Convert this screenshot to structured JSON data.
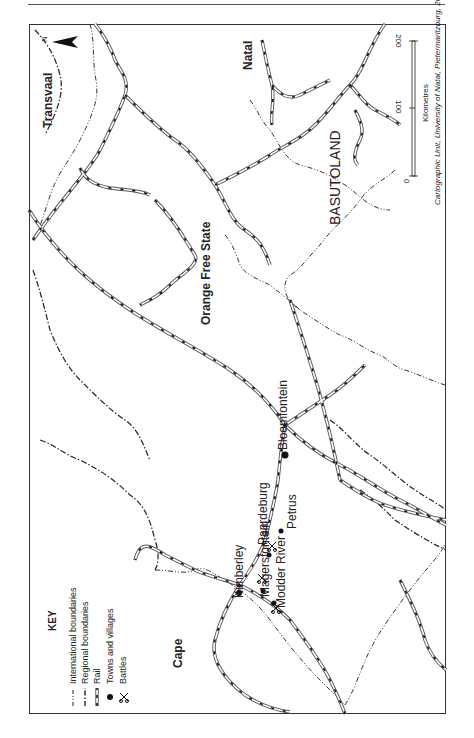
{
  "map": {
    "orientation": "rotated 90° counter-clockwise (north points left)",
    "regions": [
      {
        "name": "Transvaal",
        "bold": true
      },
      {
        "name": "Natal",
        "bold": true
      },
      {
        "name": "Orange Free State",
        "bold": true
      },
      {
        "name": "BASUTOLAND",
        "bold": false
      },
      {
        "name": "Cape",
        "bold": true
      }
    ],
    "towns": [
      "Kimberley",
      "Magersfontein",
      "Modder River",
      "Paardeburg",
      "Petrus",
      "Bloemfontein"
    ],
    "battles": [
      "Magersfontein",
      "Modder River",
      "Paardeburg"
    ],
    "north_label": "N",
    "key": {
      "title": "KEY",
      "items": [
        {
          "symbol": "dash-dot-dot line",
          "label": "International boundaries"
        },
        {
          "symbol": "dash-dot line",
          "label": "Regional boundaries"
        },
        {
          "symbol": "double line with black dashes",
          "label": "Rail"
        },
        {
          "symbol": "filled circle",
          "label": "Towns and villages"
        },
        {
          "symbol": "crossed swords",
          "label": "Battles"
        }
      ]
    },
    "scale": {
      "ticks": [
        "0",
        "100",
        "200"
      ],
      "unit": "Kilometres"
    },
    "credit": "Cartographic Unit, University of Natal, Pietermaritzburg, 2000"
  }
}
